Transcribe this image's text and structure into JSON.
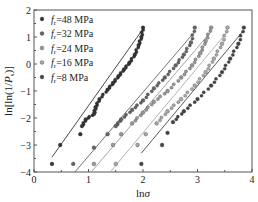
{
  "chart_data": {
    "type": "scatter",
    "title": "",
    "xlabel": "lnσ",
    "ylabel": "ln[ln(1/Ps)]",
    "xlim": [
      0,
      4
    ],
    "ylim": [
      -4,
      2
    ],
    "xticks": [
      "0",
      "1",
      "2",
      "3",
      "4"
    ],
    "yticks": [
      "2",
      "1",
      "0",
      "-1",
      "-2",
      "-3",
      "-4"
    ],
    "grid": false,
    "legend_position": "upper left",
    "series": [
      {
        "name": "fr=48 MPa",
        "color": "#333333",
        "x": [
          0.33,
          0.48,
          0.85,
          0.88,
          0.95,
          1.1,
          1.13,
          1.2,
          1.35,
          1.45,
          1.55,
          1.65,
          1.75,
          1.85,
          1.92,
          1.97,
          2.0
        ],
        "y": [
          -3.7,
          -3.0,
          -2.6,
          -2.3,
          -2.05,
          -1.85,
          -1.6,
          -1.3,
          -0.95,
          -0.7,
          -0.45,
          -0.2,
          0.05,
          0.35,
          0.7,
          1.0,
          1.35
        ],
        "fit": [
          [
            0.33,
            -3.45
          ],
          [
            2.0,
            1.3
          ]
        ]
      },
      {
        "name": "fr=32 MPa",
        "color": "#666666",
        "x": [
          0.72,
          1.1,
          1.35,
          1.5,
          1.6,
          1.8,
          2.0,
          2.2,
          2.4,
          2.6,
          2.75,
          2.88,
          2.95
        ],
        "y": [
          -3.7,
          -3.1,
          -2.6,
          -2.3,
          -2.05,
          -1.7,
          -1.35,
          -0.9,
          -0.5,
          -0.05,
          0.35,
          0.8,
          1.35
        ],
        "fit": [
          [
            0.75,
            -4.0
          ],
          [
            2.95,
            1.2
          ]
        ]
      },
      {
        "name": "fr=24 MPa",
        "color": "#999999",
        "x": [
          1.1,
          1.45,
          1.6,
          1.8,
          2.0,
          2.2,
          2.45,
          2.7,
          2.9,
          3.05,
          3.15,
          3.25
        ],
        "y": [
          -3.7,
          -3.0,
          -2.6,
          -2.2,
          -1.8,
          -1.4,
          -1.0,
          -0.5,
          -0.05,
          0.4,
          0.85,
          1.35
        ],
        "fit": [
          [
            1.05,
            -4.0
          ],
          [
            3.25,
            1.2
          ]
        ]
      },
      {
        "name": "fr=16 MPa",
        "color": "#aaaaaa",
        "x": [
          1.5,
          1.9,
          2.05,
          2.25,
          2.45,
          2.7,
          2.95,
          3.15,
          3.3,
          3.45,
          3.55
        ],
        "y": [
          -3.7,
          -3.0,
          -2.6,
          -2.2,
          -1.75,
          -1.3,
          -0.8,
          -0.3,
          0.2,
          0.75,
          1.35
        ],
        "fit": [
          [
            1.4,
            -4.0
          ],
          [
            3.55,
            1.2
          ]
        ]
      },
      {
        "name": "fr=8 MPa",
        "color": "#444444",
        "x": [
          1.97,
          2.35,
          2.45,
          2.55,
          2.75,
          3.0,
          3.25,
          3.45,
          3.6,
          3.75,
          3.85
        ],
        "y": [
          -3.7,
          -3.0,
          -2.55,
          -2.15,
          -1.75,
          -1.3,
          -0.8,
          -0.3,
          0.2,
          0.75,
          1.35
        ],
        "fit": [
          [
            1.97,
            -3.3
          ],
          [
            3.85,
            1.25
          ]
        ]
      }
    ]
  },
  "legend": {
    "items": [
      {
        "prefix": "f",
        "sub": "r",
        "value": "=48 MPa"
      },
      {
        "prefix": "f",
        "sub": "r",
        "value": "=32 MPa"
      },
      {
        "prefix": "f",
        "sub": "r",
        "value": "=24 MPa"
      },
      {
        "prefix": "f",
        "sub": "r",
        "value": "=16 MPa"
      },
      {
        "prefix": "f",
        "sub": "r",
        "value": "=8 MPa"
      }
    ]
  },
  "axes": {
    "x_label_main": "ln",
    "x_label_sym": "σ",
    "y_label_a": "ln[ln(1/",
    "y_label_p": "P",
    "y_label_sub": "s",
    "y_label_b": ")]"
  }
}
